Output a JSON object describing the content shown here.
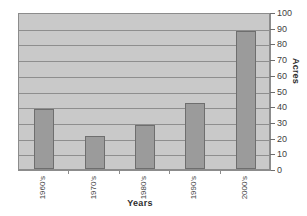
{
  "chart_data": {
    "type": "bar",
    "title": "",
    "xlabel": "Years",
    "ylabel": "Acres",
    "categories": [
      "1960's",
      "1970's",
      "1980's",
      "1990's",
      "2000's"
    ],
    "values": [
      38,
      21,
      28,
      42,
      88
    ],
    "ylim": [
      0,
      100
    ],
    "y_ticks": [
      0,
      10,
      20,
      30,
      40,
      50,
      60,
      70,
      80,
      90,
      100
    ],
    "y_tick_labels": [
      "0",
      "10",
      "20",
      "30",
      "40",
      "50",
      "60",
      "70",
      "80",
      "90",
      "100"
    ],
    "grid": true,
    "grid_axis": "y",
    "legend": false,
    "legend_position": "none",
    "series": [
      {
        "name": "Acres",
        "values": [
          38,
          21,
          28,
          42,
          88
        ]
      }
    ],
    "colors": {
      "bar_fill": "#9b9b9b",
      "bar_border": "#6e6e6e",
      "plot_background": "#c9c9c9",
      "gridline": "#8e8e8e",
      "axis": "#8c8c8c",
      "text": "#3f3f3f",
      "page_background": "#ffffff"
    },
    "y_axis_side": "right"
  }
}
